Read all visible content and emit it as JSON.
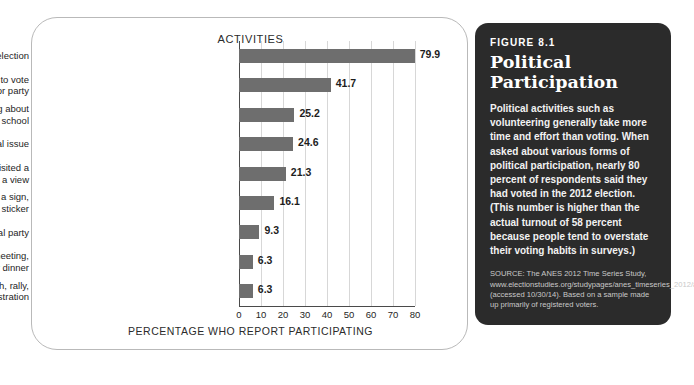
{
  "chart_card": {
    "header": "ACTIVITIES",
    "xaxis_title": "PERCENTAGE WHO REPORT PARTICIPATING"
  },
  "chart_data": {
    "type": "bar",
    "orientation": "horizontal",
    "title": "ACTIVITIES",
    "xlabel": "PERCENTAGE WHO REPORT PARTICIPATING",
    "ylabel": "",
    "xlim": [
      0,
      80
    ],
    "ticks": [
      "0",
      "10",
      "20",
      "30",
      "40",
      "50",
      "60",
      "70",
      "80"
    ],
    "tick_values": [
      0,
      10,
      20,
      30,
      40,
      50,
      60,
      70,
      80
    ],
    "grid": true,
    "legend": "none",
    "bar_color": "#6e6e6e",
    "categories": [
      "Voted in a general election",
      "Attempted to persuade others to vote for or against a candidate or party",
      "Attended local community meeting about an issue facing one's community or school",
      "Signed a petition about a political or social issue",
      "Telephoned, wrote a letter to, or visited a government official to express a view",
      "Wore a button, posted a sign, or displayed a bumper sticker",
      "Donated money to a political party",
      "Attended a political rally, meeting, speech, or dinner",
      "Joined a protest march, rally, or demonstration"
    ],
    "category_lines": [
      [
        "Voted in a general election"
      ],
      [
        "Attempted to persuade others to vote",
        "for or against a candidate or party"
      ],
      [
        "Attended local community meeting about",
        "an issue facing one's community or school"
      ],
      [
        "Signed a petition about a political or social issue"
      ],
      [
        "Telephoned, wrote a letter to, or visited a",
        "government official to express a view"
      ],
      [
        "Wore a button, posted a sign,",
        "or displayed a bumper sticker"
      ],
      [
        "Donated money to a political party"
      ],
      [
        "Attended a political rally, meeting,",
        "speech, or dinner"
      ],
      [
        "Joined a protest march, rally,",
        "or demonstration"
      ]
    ],
    "values": [
      79.9,
      41.7,
      25.2,
      24.6,
      21.3,
      16.1,
      9.3,
      6.3,
      6.3
    ],
    "value_labels": [
      "79.9",
      "41.7",
      "25.2",
      "24.6",
      "21.3",
      "16.1",
      "9.3",
      "6.3",
      "6.3"
    ]
  },
  "figure_panel": {
    "figure_number": "FIGURE 8.1",
    "title_line1": "Political",
    "title_line2": "Participation",
    "body": "Political activities such as volunteering generally take more time and effort than voting. When asked about various forms of political participation, nearly 80 percent of respondents said they had voted in the 2012 election. (This number is higher than the actual turnout of 58 percent because people tend to overstate their voting habits in surveys.)",
    "source": "SOURCE: The ANES 2012 Time Series Study, www.electionstudies.org/studypages/anes_timeseries_2012/anes_timeseries_2012.htm (accessed 10/30/14). Based on a sample made up primarily of registered voters.",
    "background_color": "#2b2b2b"
  }
}
